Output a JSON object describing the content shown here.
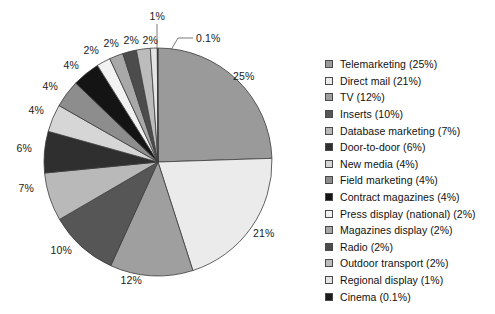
{
  "chart_data": {
    "type": "pie",
    "title": "",
    "xlabel": "",
    "ylabel": "",
    "legend_position": "right",
    "grid": false,
    "start_angle_deg": 0,
    "direction": "clockwise",
    "categories": [
      "Telemarketing",
      "Direct mail",
      "TV",
      "Inserts",
      "Database marketing",
      "Door-to-door",
      "New media",
      "Field marketing",
      "Contract magazines",
      "Press display (national)",
      "Magazines display",
      "Radio",
      "Outdoor transport",
      "Regional display",
      "Cinema"
    ],
    "values": [
      25,
      21,
      12,
      10,
      7,
      6,
      4,
      4,
      4,
      2,
      2,
      2,
      2,
      1,
      0.1
    ],
    "slice_labels": [
      "25%",
      "21%",
      "12%",
      "10%",
      "7%",
      "6%",
      "4%",
      "4%",
      "4%",
      "2%",
      "2%",
      "2%",
      "2%",
      "1%",
      "0.1%"
    ],
    "colors": [
      "#9a9a9a",
      "#ebebeb",
      "#9f9f9f",
      "#565656",
      "#b9b9b9",
      "#2f2f2f",
      "#d6d6d6",
      "#8d8d8d",
      "#141414",
      "#f2f2f2",
      "#a8a8a8",
      "#4c4c4c",
      "#bcbcbc",
      "#e4e4e4",
      "#1c1c1c"
    ],
    "legend_entries": [
      {
        "label": "Telemarketing (25%)",
        "color": "#9a9a9a"
      },
      {
        "label": "Direct mail (21%)",
        "color": "#ebebeb"
      },
      {
        "label": "TV (12%)",
        "color": "#9f9f9f"
      },
      {
        "label": "Inserts (10%)",
        "color": "#565656"
      },
      {
        "label": "Database marketing (7%)",
        "color": "#b9b9b9"
      },
      {
        "label": "Door-to-door (6%)",
        "color": "#2f2f2f"
      },
      {
        "label": "New media (4%)",
        "color": "#d6d6d6"
      },
      {
        "label": "Field marketing (4%)",
        "color": "#8d8d8d"
      },
      {
        "label": "Contract magazines  (4%)",
        "color": "#141414"
      },
      {
        "label": "Press display (national) (2%)",
        "color": "#f2f2f2"
      },
      {
        "label": "Magazines display (2%)",
        "color": "#a8a8a8"
      },
      {
        "label": "Radio (2%)",
        "color": "#4c4c4c"
      },
      {
        "label": "Outdoor transport (2%)",
        "color": "#bcbcbc"
      },
      {
        "label": "Regional display (1%)",
        "color": "#e4e4e4"
      },
      {
        "label": "Cinema (0.1%)",
        "color": "#1c1c1c"
      }
    ],
    "geometry": {
      "center_x": 158,
      "center_y": 162,
      "radius": 114,
      "stroke": "#3c3c3c"
    },
    "callouts": [
      {
        "label": "1%",
        "kind": "leader-vertical"
      },
      {
        "label": "0.1%",
        "kind": "leader-elbow"
      }
    ]
  }
}
